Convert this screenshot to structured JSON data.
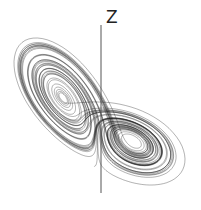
{
  "figure": {
    "axis_label": "Z",
    "colors": {
      "background": "#ffffff",
      "trajectory": "#1a1a1a",
      "axis": "#555555"
    },
    "axis_line": {
      "x": 101,
      "y_top": 25,
      "y_bottom": 193
    },
    "lorenz_params": {
      "sigma": 10,
      "rho": 28,
      "beta": 2.6667,
      "dt": 0.006,
      "steps": 9000
    }
  }
}
